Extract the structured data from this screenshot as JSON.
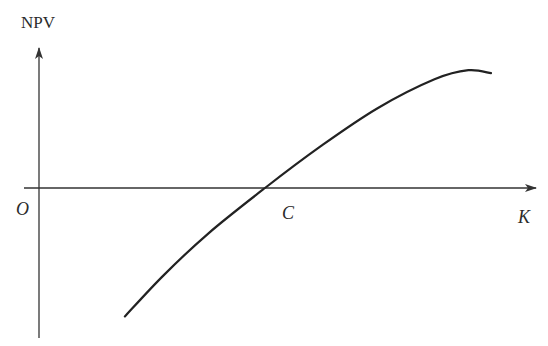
{
  "chart_data": {
    "type": "line",
    "title": "",
    "xlabel": "K",
    "ylabel": "NPV",
    "origin_label": "O",
    "annotations": [
      {
        "text": "C",
        "x": 1.0,
        "y": 0,
        "note": "x-intercept of NPV curve"
      }
    ],
    "xlim": [
      0,
      2.0
    ],
    "ylim": [
      -1.0,
      1.0
    ],
    "grid": false,
    "legend": "none",
    "colors": {
      "axis": "#333333",
      "curve": "#222222",
      "text": "#2b2b2b"
    },
    "series": [
      {
        "name": "NPV(K)",
        "x": [
          0.38,
          0.55,
          0.75,
          1.0,
          1.25,
          1.5,
          1.75,
          1.9,
          2.0
        ],
        "y": [
          -0.85,
          -0.58,
          -0.3,
          0.0,
          0.28,
          0.53,
          0.72,
          0.78,
          0.76
        ]
      }
    ]
  }
}
